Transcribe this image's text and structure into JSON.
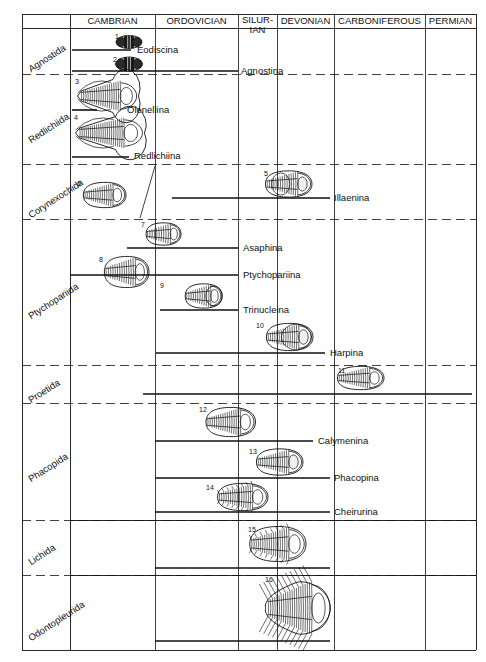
{
  "figure": {
    "kind": "stratigraphic-range-chart",
    "ink_color": "#111111",
    "background": "#ffffff"
  },
  "periods": [
    {
      "name": "CAMBRIAN",
      "x0": 70,
      "x1": 155
    },
    {
      "name": "ORDOVICIAN",
      "x0": 155,
      "x1": 238
    },
    {
      "name": "SILUR-\nIAN",
      "x0": 238,
      "x1": 277,
      "line1": "SILUR-",
      "line2": "IAN"
    },
    {
      "name": "DEVONIAN",
      "x0": 277,
      "x1": 334
    },
    {
      "name": "CARBONIFEROUS",
      "x0": 334,
      "x1": 425
    },
    {
      "name": "PERMIAN",
      "x0": 425,
      "x1": 476
    }
  ],
  "orders": [
    {
      "label": "Agnostida",
      "y0": 28,
      "y1": 74
    },
    {
      "label": "Redlichiida",
      "y0": 74,
      "y1": 164
    },
    {
      "label": "Corynexochida",
      "y0": 164,
      "y1": 219
    },
    {
      "label": "Ptychopariida",
      "y0": 219,
      "y1": 365
    },
    {
      "label": "Proetida",
      "y0": 365,
      "y1": 403
    },
    {
      "label": "Phacopida",
      "y0": 403,
      "y1": 520
    },
    {
      "label": "Lichida",
      "y0": 520,
      "y1": 575
    },
    {
      "label": "Odontopleurida",
      "y0": 575,
      "y1": 650
    }
  ],
  "suborders": [
    {
      "name": "Eodiscina",
      "x0": 72,
      "x1": 131,
      "y": 50,
      "label_x": 137,
      "label_y": 45
    },
    {
      "name": "Agnostina",
      "x0": 72,
      "x1": 238,
      "y": 71,
      "label_x": 241,
      "label_y": 66
    },
    {
      "name": "Olenellina",
      "x0": 72,
      "x1": 97,
      "y": 110,
      "label_x": 127,
      "label_y": 105
    },
    {
      "name": "Redlichiina",
      "x0": 72,
      "x1": 129,
      "y": 157,
      "label_x": 134,
      "label_y": 151
    },
    {
      "name": "Illaenina",
      "x0": 172,
      "x1": 330,
      "y": 198,
      "label_x": 334,
      "label_y": 193
    },
    {
      "name": "Asaphina",
      "x0": 127,
      "x1": 238,
      "y": 248,
      "label_x": 243,
      "label_y": 243
    },
    {
      "name": "Ptychopariina",
      "x0": 70,
      "x1": 238,
      "y": 275,
      "label_x": 243,
      "label_y": 270
    },
    {
      "name": "Trinucleina",
      "x0": 160,
      "x1": 238,
      "y": 310,
      "label_x": 243,
      "label_y": 305
    },
    {
      "name": "Harpina",
      "x0": 156,
      "x1": 325,
      "y": 353,
      "label_x": 330,
      "label_y": 348
    },
    {
      "name": "Calymenina",
      "x0": 155,
      "x1": 313,
      "y": 441,
      "label_x": 318,
      "label_y": 436
    },
    {
      "name": "Phacopina",
      "x0": 155,
      "x1": 330,
      "y": 478,
      "label_x": 334,
      "label_y": 473
    },
    {
      "name": "Cheirurina",
      "x0": 155,
      "x1": 330,
      "y": 512,
      "label_x": 334,
      "label_y": 507
    }
  ],
  "unlabeled_ranges": [
    {
      "order": "Proetida",
      "x0": 143,
      "x1": 472,
      "y": 394
    },
    {
      "order": "Lichida",
      "x0": 155,
      "x1": 330,
      "y": 568
    },
    {
      "order": "Odontopleurida",
      "x0": 155,
      "x1": 330,
      "y": 641
    }
  ],
  "specimens": [
    {
      "num": "1",
      "cx": 129,
      "cy": 42,
      "w": 26,
      "h": 13,
      "style": "agnostid",
      "num_x": 115,
      "num_y": 33
    },
    {
      "num": "2",
      "cx": 129,
      "cy": 64,
      "w": 27,
      "h": 14,
      "style": "agnostid",
      "num_x": 113,
      "num_y": 56
    },
    {
      "num": "3",
      "cx": 108,
      "cy": 96,
      "w": 61,
      "h": 33,
      "style": "olenellid",
      "num_x": 75,
      "num_y": 78
    },
    {
      "num": "4",
      "cx": 110,
      "cy": 133,
      "w": 69,
      "h": 33,
      "style": "redlichiid",
      "num_x": 74,
      "num_y": 114
    },
    {
      "num": "5",
      "cx": 288,
      "cy": 184,
      "w": 48,
      "h": 27,
      "style": "illaenid",
      "num_x": 264,
      "num_y": 170
    },
    {
      "num": "6",
      "cx": 104,
      "cy": 195,
      "w": 44,
      "h": 26,
      "style": "corynexochid",
      "num_x": 77,
      "num_y": 180
    },
    {
      "num": "7",
      "cx": 163,
      "cy": 234,
      "w": 36,
      "h": 23,
      "style": "asaphid",
      "num_x": 141,
      "num_y": 221
    },
    {
      "num": "8",
      "cx": 126,
      "cy": 272,
      "w": 46,
      "h": 32,
      "style": "ptychopariid",
      "num_x": 99,
      "num_y": 256
    },
    {
      "num": "9",
      "cx": 203,
      "cy": 296,
      "w": 38,
      "h": 25,
      "style": "trinucleid",
      "num_x": 160,
      "num_y": 282
    },
    {
      "num": "10",
      "cx": 289,
      "cy": 337,
      "w": 48,
      "h": 28,
      "style": "harpid",
      "num_x": 256,
      "num_y": 322
    },
    {
      "num": "11",
      "cx": 360,
      "cy": 378,
      "w": 48,
      "h": 24,
      "style": "proetid",
      "num_x": 338,
      "num_y": 367
    },
    {
      "num": "12",
      "cx": 230,
      "cy": 422,
      "w": 51,
      "h": 30,
      "style": "calymenid",
      "num_x": 199,
      "num_y": 406
    },
    {
      "num": "13",
      "cx": 279,
      "cy": 462,
      "w": 48,
      "h": 27,
      "style": "phacopid",
      "num_x": 249,
      "num_y": 448
    },
    {
      "num": "14",
      "cx": 242,
      "cy": 497,
      "w": 52,
      "h": 28,
      "style": "cheirurid",
      "num_x": 206,
      "num_y": 484
    },
    {
      "num": "15",
      "cx": 277,
      "cy": 544,
      "w": 58,
      "h": 36,
      "style": "lichid",
      "num_x": 248,
      "num_y": 526
    },
    {
      "num": "16",
      "cx": 298,
      "cy": 608,
      "w": 68,
      "h": 58,
      "style": "odontopleurid",
      "num_x": 265,
      "num_y": 576
    }
  ],
  "connector": {
    "x0": 155,
    "y0": 166,
    "x1": 140,
    "y1": 218,
    "note": "diagonal tie-line from Corynexochida cell"
  }
}
